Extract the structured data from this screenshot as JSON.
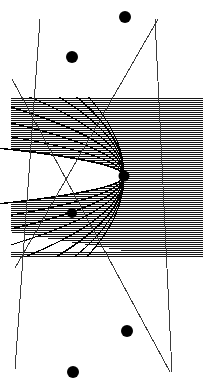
{
  "figure": {
    "canvas": {
      "width": 210,
      "height": 387,
      "background": "#ffffff"
    },
    "colors": {
      "ink": "#000000",
      "hatch": "#111111",
      "curve": "#000000",
      "ray": "#3a3a3a",
      "background": "#ffffff"
    },
    "hatch_region": {
      "name": "horizontally-hatched rectangle",
      "x": 11,
      "y": 97,
      "width": 192,
      "height": 160,
      "line_spacing": 2,
      "line_width": 1,
      "orientation": "horizontal"
    },
    "focus": {
      "label": "focus",
      "x": 124,
      "y": 176,
      "radius": 5.5
    },
    "white_cavity": {
      "note": "unhatched parabolic interior opening to the left",
      "vertex_x": 124,
      "vertex_y": 176,
      "left_extent_x": 6,
      "half_height_at_left": 27
    },
    "parabolas": [
      {
        "a": 1.6,
        "opens": "left"
      },
      {
        "a": 3.4,
        "opens": "left"
      },
      {
        "a": 6.2,
        "opens": "left"
      },
      {
        "a": 10.5,
        "opens": "left"
      },
      {
        "a": 16.5,
        "opens": "left"
      },
      {
        "a": 24.0,
        "opens": "left"
      },
      {
        "a": 33.0,
        "opens": "left"
      },
      {
        "a": 44.0,
        "opens": "left"
      },
      {
        "a": -1.6,
        "opens": "left"
      },
      {
        "a": -3.4,
        "opens": "left"
      },
      {
        "a": -6.2,
        "opens": "left"
      },
      {
        "a": -10.5,
        "opens": "left"
      },
      {
        "a": -16.5,
        "opens": "left"
      },
      {
        "a": -24.0,
        "opens": "left"
      },
      {
        "a": -33.0,
        "opens": "left"
      },
      {
        "a": -44.0,
        "opens": "left"
      }
    ],
    "rays": [
      {
        "name": "ray-1",
        "x1": 40,
        "y1": 19,
        "x2": 15,
        "y2": 369
      },
      {
        "name": "ray-2",
        "x1": 155,
        "y1": 19,
        "x2": 172,
        "y2": 372
      },
      {
        "name": "ray-3",
        "x1": 12,
        "y1": 79,
        "x2": 170,
        "y2": 372
      },
      {
        "name": "ray-4",
        "x1": 15,
        "y1": 268,
        "x2": 158,
        "y2": 19
      }
    ],
    "dots": [
      {
        "name": "dot-top",
        "x": 125,
        "y": 17,
        "r": 6.0
      },
      {
        "name": "dot-upper-left",
        "x": 72,
        "y": 57,
        "r": 6.0
      },
      {
        "name": "dot-focus",
        "x": 124,
        "y": 176,
        "r": 5.5
      },
      {
        "name": "dot-lower-left",
        "x": 72,
        "y": 213,
        "r": 5.0
      },
      {
        "name": "dot-lower-right",
        "x": 127,
        "y": 331,
        "r": 6.0
      },
      {
        "name": "dot-bottom",
        "x": 73,
        "y": 372,
        "r": 6.0
      }
    ]
  }
}
